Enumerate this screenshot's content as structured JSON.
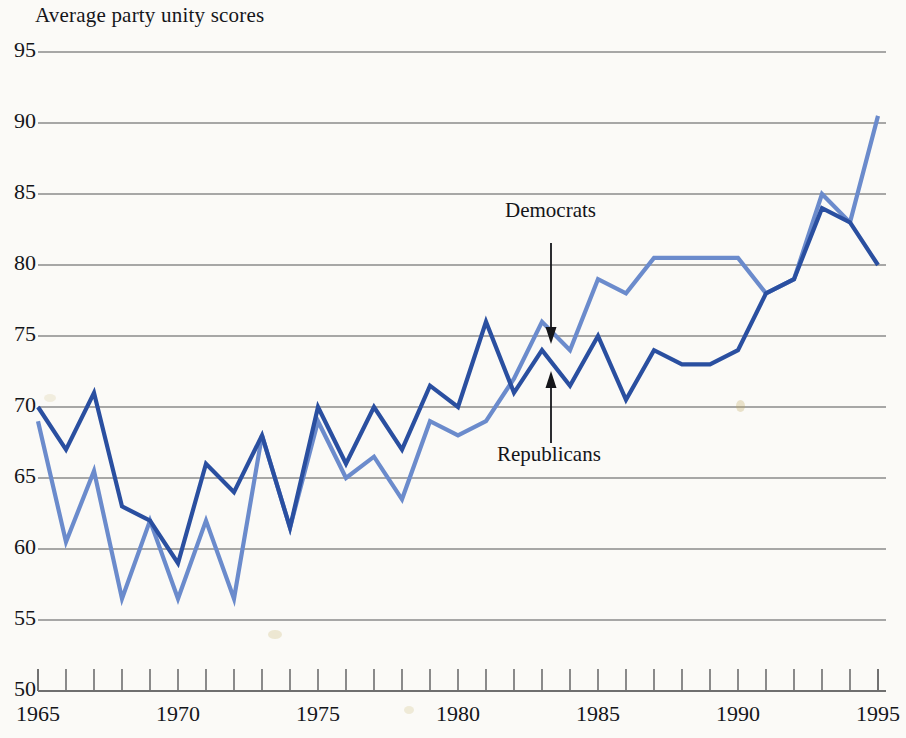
{
  "title": "Average party unity scores",
  "axes": {
    "y_ticks": [
      "95",
      "90",
      "85",
      "80",
      "75",
      "70",
      "65",
      "60",
      "55",
      "50"
    ],
    "x_ticks": [
      "1965",
      "1970",
      "1975",
      "1980",
      "1985",
      "1990",
      "1995"
    ]
  },
  "annotations": {
    "democrats": "Democrats",
    "republicans": "Republicans"
  },
  "colors": {
    "democrats": "#6b8bcc",
    "republicans": "#2a4fa0",
    "gridline": "#8b8b8b",
    "axis": "#6f6f6f",
    "background": "#fbfaf7",
    "text": "#141519"
  },
  "chart_data": {
    "type": "line",
    "title": "Average party unity scores",
    "xlabel": "",
    "ylabel": "Average party unity scores",
    "xlim": [
      1965,
      1995
    ],
    "ylim": [
      50,
      95
    ],
    "grid": true,
    "legend_position": "inline-annotations",
    "x": [
      1965,
      1966,
      1967,
      1968,
      1969,
      1970,
      1971,
      1972,
      1973,
      1974,
      1975,
      1976,
      1977,
      1978,
      1979,
      1980,
      1981,
      1982,
      1983,
      1984,
      1985,
      1986,
      1987,
      1988,
      1989,
      1990,
      1991,
      1992,
      1993,
      1994,
      1995
    ],
    "series": [
      {
        "name": "Democrats",
        "color": "#6b8bcc",
        "values": [
          69,
          60.5,
          65.5,
          56.5,
          62,
          56.5,
          62,
          56.5,
          68,
          61.5,
          69,
          65,
          66.5,
          63.5,
          69,
          68,
          69,
          72,
          76,
          74,
          79,
          78,
          80.5,
          80.5,
          80.5,
          80.5,
          78,
          79,
          85,
          83,
          90.5
        ]
      },
      {
        "name": "Republicans",
        "color": "#2a4fa0",
        "values": [
          70,
          67,
          71,
          63,
          62,
          59,
          66,
          64,
          68,
          61.5,
          70,
          66,
          70,
          67,
          71.5,
          70,
          76,
          71,
          74,
          71.5,
          75,
          70.5,
          74,
          73,
          73,
          74,
          78,
          79,
          84,
          83,
          80
        ]
      }
    ]
  }
}
